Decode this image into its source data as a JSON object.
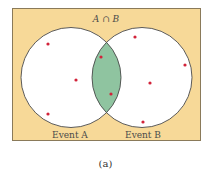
{
  "diagram": {
    "type": "venn",
    "title_label": "A ∩ B",
    "caption": "(a)",
    "colors": {
      "background": "#f7d998",
      "frame": "#8a7a5a",
      "circle_fill": "#ffffff",
      "circle_stroke": "#4a4a4a",
      "intersection_fill": "#8fc4a0",
      "dot": "#d2233a",
      "text": "#4a4a4a"
    },
    "sets": [
      {
        "name": "A",
        "label": "Event A",
        "cx": 71,
        "cy": 77.5,
        "r": 50
      },
      {
        "name": "B",
        "label": "Event B",
        "cx": 142,
        "cy": 77.5,
        "r": 50
      }
    ],
    "points": [
      {
        "region": "A only",
        "x": 48,
        "y": 44
      },
      {
        "region": "A only",
        "x": 76,
        "y": 80
      },
      {
        "region": "A only",
        "x": 48,
        "y": 114
      },
      {
        "region": "A and B",
        "x": 101,
        "y": 57
      },
      {
        "region": "A and B",
        "x": 111,
        "y": 94
      },
      {
        "region": "B only",
        "x": 135,
        "y": 37
      },
      {
        "region": "B only",
        "x": 185,
        "y": 65
      },
      {
        "region": "B only",
        "x": 150,
        "y": 83
      },
      {
        "region": "B only",
        "x": 143,
        "y": 122
      }
    ],
    "counts": {
      "A_only": 3,
      "A_and_B": 2,
      "B_only": 4
    }
  }
}
